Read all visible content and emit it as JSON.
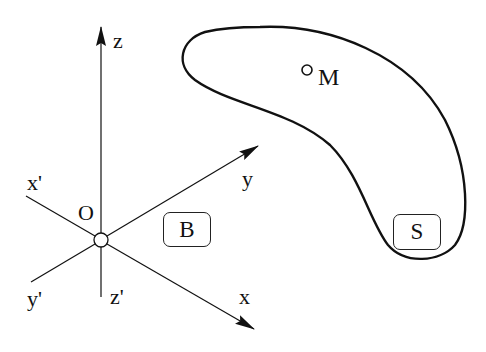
{
  "diagram": {
    "type": "coordinate-frame-and-body",
    "axes": {
      "z": {
        "label": "z",
        "negative_label": "z'"
      },
      "y": {
        "label": "y",
        "negative_label": "y'"
      },
      "x": {
        "label": "x",
        "negative_label": "x'"
      }
    },
    "origin": {
      "label": "O"
    },
    "frame_box": {
      "label": "B"
    },
    "body": {
      "box_label": "S",
      "point": {
        "label": "M"
      }
    },
    "colors": {
      "stroke": "#111111",
      "background": "#ffffff"
    }
  }
}
